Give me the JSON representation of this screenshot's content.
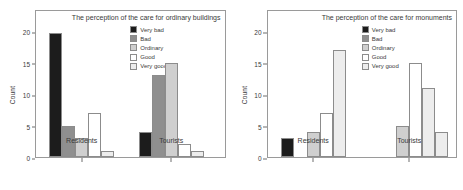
{
  "figure": {
    "background": "#ffffff",
    "axis_color": "#9a9a9a",
    "text_color": "#3a3a3a"
  },
  "series_styles": [
    {
      "name": "Very bad",
      "fill": "#1c1c1c",
      "stroke": "#8c8c8c"
    },
    {
      "name": "Bad",
      "fill": "#8f8f8f",
      "stroke": "#8c8c8c"
    },
    {
      "name": "Ordinary",
      "fill": "#cfcfcf",
      "stroke": "#8c8c8c"
    },
    {
      "name": "Good",
      "fill": "#ffffff",
      "stroke": "#8c8c8c"
    },
    {
      "name": "Very good",
      "fill": "#ededed",
      "stroke": "#8c8c8c"
    }
  ],
  "panels": [
    {
      "id": "ordinary-buildings",
      "title": "The perception of the care for ordinary buildings",
      "ylabel": "Count",
      "yticks": [
        0,
        5,
        10,
        15,
        20
      ],
      "ylim": [
        0,
        21
      ],
      "categories": [
        "Residents",
        "Tourists"
      ],
      "legend": [
        "Very bad",
        "Bad",
        "Ordinary",
        "Good",
        "Very good"
      ]
    },
    {
      "id": "monuments",
      "title": "The perception of the care for monuments",
      "ylabel": "Count",
      "yticks": [
        0,
        5,
        10,
        15,
        20
      ],
      "ylim": [
        0,
        21
      ],
      "categories": [
        "Residents",
        "Tourists"
      ],
      "legend": [
        "Very bad",
        "Bad",
        "Ordinary",
        "Good",
        "Very good"
      ]
    }
  ],
  "chart_data": [
    {
      "type": "bar",
      "title": "The perception of the care for ordinary buildings",
      "xlabel": "",
      "ylabel": "Count",
      "ylim": [
        0,
        21
      ],
      "yticks": [
        0,
        5,
        10,
        15,
        20
      ],
      "grid": false,
      "legend_position": "inside-top-center",
      "categories": [
        "Residents",
        "Tourists"
      ],
      "series": [
        {
          "name": "Very bad",
          "values": [
            19.7,
            4
          ]
        },
        {
          "name": "Bad",
          "values": [
            5,
            13
          ]
        },
        {
          "name": "Ordinary",
          "values": [
            3,
            15
          ]
        },
        {
          "name": "Good",
          "values": [
            7,
            2
          ]
        },
        {
          "name": "Very good",
          "values": [
            1,
            1
          ]
        }
      ]
    },
    {
      "type": "bar",
      "title": "The perception of the care for monuments",
      "xlabel": "",
      "ylabel": "Count",
      "ylim": [
        0,
        21
      ],
      "yticks": [
        0,
        5,
        10,
        15,
        20
      ],
      "grid": false,
      "legend_position": "inside-top-center",
      "categories": [
        "Residents",
        "Tourists"
      ],
      "series": [
        {
          "name": "Very bad",
          "values": [
            3,
            0
          ]
        },
        {
          "name": "Bad",
          "values": [
            0,
            0
          ]
        },
        {
          "name": "Ordinary",
          "values": [
            4,
            5
          ]
        },
        {
          "name": "Good",
          "values": [
            7,
            15
          ]
        },
        {
          "name": "Very good",
          "values": [
            17,
            11
          ]
        }
      ],
      "extra_bars": [
        {
          "category": "Tourists",
          "series": "Very good",
          "value": 4
        }
      ]
    }
  ]
}
